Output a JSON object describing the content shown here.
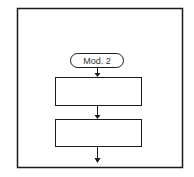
{
  "diagram": {
    "type": "flowchart",
    "terminal": {
      "label": "Mod. 2"
    },
    "process_boxes": [
      {
        "label": ""
      },
      {
        "label": ""
      }
    ],
    "colors": {
      "stroke": "#1a1a1a",
      "background": "#ffffff"
    }
  }
}
